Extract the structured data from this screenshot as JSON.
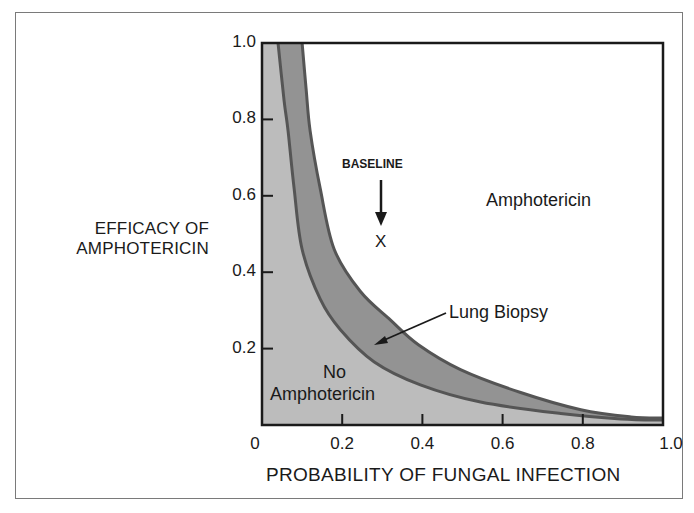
{
  "chart_data": {
    "type": "area",
    "title": "",
    "xlabel": "PROBABILITY OF FUNGAL INFECTION",
    "ylabel": "EFFICACY OF AMPHOTERICIN",
    "ylabel_lines": [
      "EFFICACY OF",
      "AMPHOTERICIN"
    ],
    "xlim": [
      0,
      1.0
    ],
    "ylim": [
      0,
      1.0
    ],
    "x_ticks": [
      "0",
      "0.2",
      "0.4",
      "0.6",
      "0.8",
      "1.0"
    ],
    "y_ticks": [
      "0.2",
      "0.4",
      "0.6",
      "0.8",
      "1.0"
    ],
    "grid": false,
    "series": [
      {
        "name": "No Amphotericin / Lung Biopsy threshold (inner curve)",
        "x": [
          0.04,
          0.055,
          0.065,
          0.08,
          0.1,
          0.145,
          0.195,
          0.28,
          0.395,
          0.545,
          0.745,
          0.895,
          1.0
        ],
        "y": [
          1.0,
          0.85,
          0.77,
          0.62,
          0.46,
          0.33,
          0.25,
          0.165,
          0.105,
          0.06,
          0.03,
          0.016,
          0.013
        ]
      },
      {
        "name": "Lung Biopsy / Amphotericin threshold (outer curve)",
        "x": [
          0.1,
          0.11,
          0.12,
          0.145,
          0.18,
          0.245,
          0.32,
          0.39,
          0.495,
          0.645,
          0.795,
          0.92,
          1.0
        ],
        "y": [
          1.0,
          0.88,
          0.77,
          0.62,
          0.46,
          0.35,
          0.275,
          0.21,
          0.145,
          0.085,
          0.04,
          0.021,
          0.018
        ]
      }
    ],
    "regions": [
      {
        "label": "No Amphotericin",
        "lines": [
          "No",
          "Amphotericin"
        ],
        "fill": "#bcbcbc"
      },
      {
        "label": "Lung Biopsy",
        "fill": "#939393"
      },
      {
        "label": "Amphotericin",
        "fill": "#ffffff"
      }
    ],
    "annotations": [
      {
        "text": "BASELINE",
        "x": 0.3,
        "y": 0.48,
        "marker": "X",
        "arrow": "down"
      },
      {
        "text": "Lung Biopsy",
        "pointer_to": [
          0.28,
          0.21
        ]
      },
      {
        "text": "Amphotericin",
        "x": 0.82,
        "y": 0.6
      },
      {
        "text": "No Amphotericin",
        "x": 0.23,
        "y": 0.12
      }
    ],
    "colors": {
      "light_region": "#bcbcbc",
      "dark_band": "#939393",
      "curve_line": "#555555",
      "axis": "#1a1a1a"
    }
  },
  "labels": {
    "baseline": "BASELINE",
    "baseline_marker": "X",
    "lung_biopsy": "Lung Biopsy",
    "amphotericin": "Amphotericin",
    "no": "No",
    "no_amphotericin": "Amphotericin"
  }
}
